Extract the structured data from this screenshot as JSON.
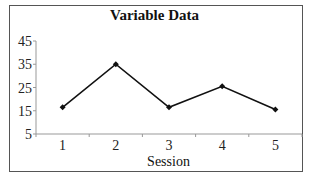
{
  "chart_data": {
    "type": "line",
    "title": "Variable Data",
    "xlabel": "Session",
    "ylabel": "",
    "categories": [
      "1",
      "2",
      "3",
      "4",
      "5"
    ],
    "series": [
      {
        "name": "Variable",
        "values": [
          16.5,
          35,
          16.5,
          25.5,
          15.5
        ],
        "color": "#111111",
        "marker": "diamond"
      }
    ],
    "yticks": [
      5,
      15,
      25,
      35,
      45
    ],
    "ylim": [
      5,
      45
    ],
    "grid": false,
    "legend": null
  }
}
